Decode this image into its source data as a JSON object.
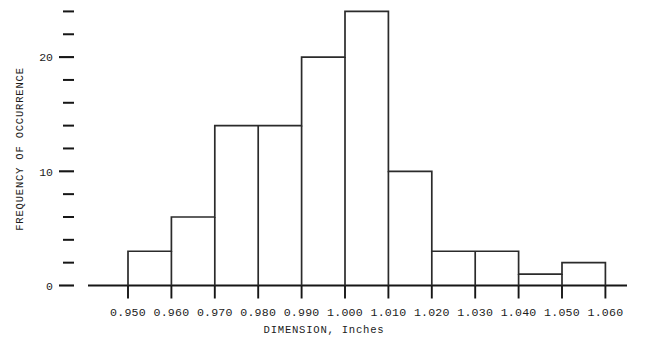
{
  "chart_data": {
    "type": "bar",
    "title": "",
    "subtitle": "",
    "xlabel": "DIMENSION, Inches",
    "ylabel": "FREQUENCY OF OCCURRENCE",
    "grid": false,
    "legend": "none",
    "bin_width": 0.01,
    "bin_edges": [
      0.95,
      0.96,
      0.97,
      0.98,
      0.99,
      1.0,
      1.01,
      1.02,
      1.03,
      1.04,
      1.05,
      1.06
    ],
    "categories": [
      "0.950-0.960",
      "0.960-0.970",
      "0.970-0.980",
      "0.980-0.990",
      "0.990-1.000",
      "1.000-1.010",
      "1.010-1.020",
      "1.020-1.030",
      "1.030-1.040",
      "1.040-1.050",
      "1.050-1.060"
    ],
    "values": [
      3,
      6,
      14,
      14,
      20,
      24,
      10,
      3,
      3,
      1,
      2
    ],
    "xlim": [
      0.95,
      1.06
    ],
    "ylim": [
      0,
      26
    ],
    "xtick_labels": [
      "0.950",
      "0.960",
      "0.970",
      "0.980",
      "0.990",
      "1.000",
      "1.010",
      "1.020",
      "1.030",
      "1.040",
      "1.050",
      "1.060"
    ],
    "xtick_values": [
      0.95,
      0.96,
      0.97,
      0.98,
      0.99,
      1.0,
      1.01,
      1.02,
      1.03,
      1.04,
      1.05,
      1.06
    ],
    "ytick_major_labels": [
      "0",
      "10",
      "20"
    ],
    "ytick_major_values": [
      0,
      10,
      20
    ],
    "ytick_all_values": [
      0,
      2,
      4,
      6,
      8,
      10,
      12,
      14,
      16,
      18,
      20,
      22,
      24
    ],
    "ytick_minor_interval": 2
  }
}
